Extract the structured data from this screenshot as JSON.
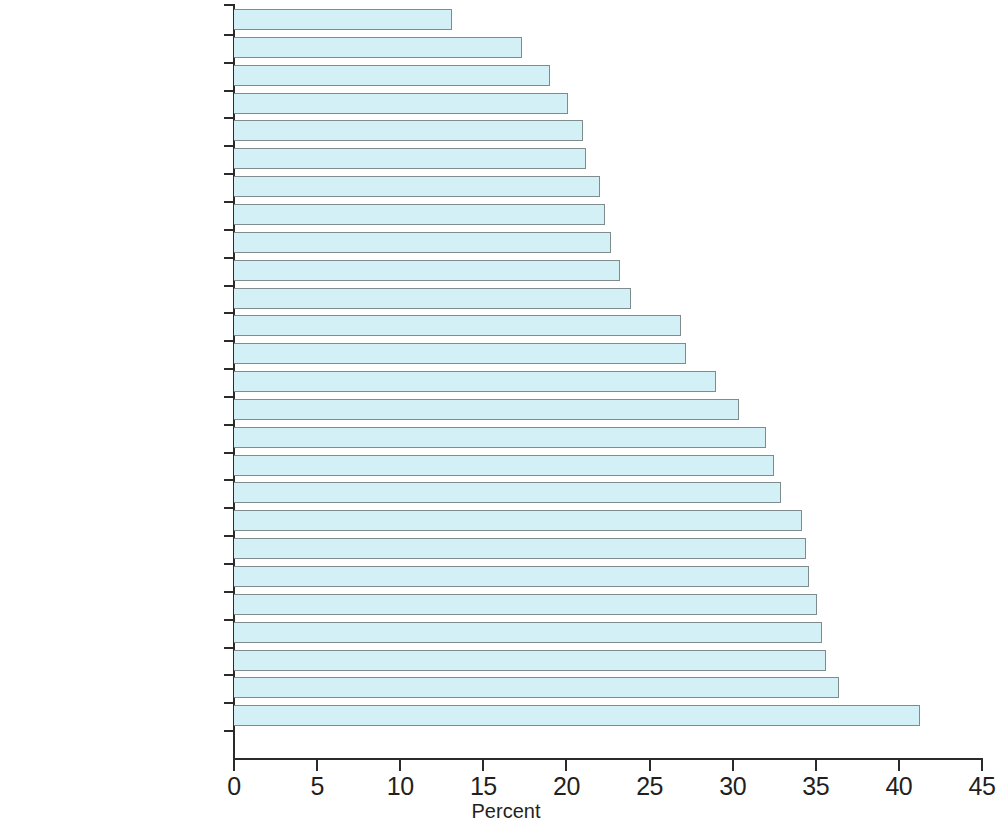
{
  "chart_data": {
    "type": "bar",
    "orientation": "horizontal",
    "title": "",
    "subtitle": "",
    "xlabel": "Percent",
    "ylabel": "",
    "xlim": [
      0,
      45
    ],
    "grid": false,
    "legend": null,
    "bar_color": "#d2f0f5",
    "bar_border_color": "#7f8c8e",
    "axis_color": "#2b2b2b",
    "xticks": [
      0,
      5,
      10,
      15,
      20,
      25,
      30,
      35,
      40,
      45
    ],
    "xtick_labels": [
      "0",
      "5",
      "10",
      "15",
      "20",
      "25",
      "30",
      "35",
      "40",
      "45"
    ],
    "categories": [
      "Tanzania",
      "Cameroon",
      "Zimbabwe",
      "Malawi",
      "Mozambique",
      "Algeria",
      "Côte d'Ivoire",
      "Djibouti",
      "Ghana",
      "Congo, Rep.",
      "Niger",
      "Central African Republic",
      "Egypt, Arab Rep.",
      "Mali",
      "Congo, Dem. Rep.",
      "Namibia",
      "Zambia",
      "Botswana",
      "Senegal",
      "South Africa",
      "Guinea",
      "Benin",
      "Mauritania",
      "Lesotho",
      "Nigeria",
      "Burkina Faso"
    ],
    "values": [
      13.1,
      17.3,
      19.0,
      20.1,
      21.0,
      21.2,
      22.0,
      22.3,
      22.7,
      23.2,
      23.9,
      26.9,
      27.2,
      29.0,
      30.4,
      32.0,
      32.5,
      32.9,
      34.2,
      34.4,
      34.6,
      35.1,
      35.4,
      35.6,
      36.4,
      41.3
    ]
  }
}
